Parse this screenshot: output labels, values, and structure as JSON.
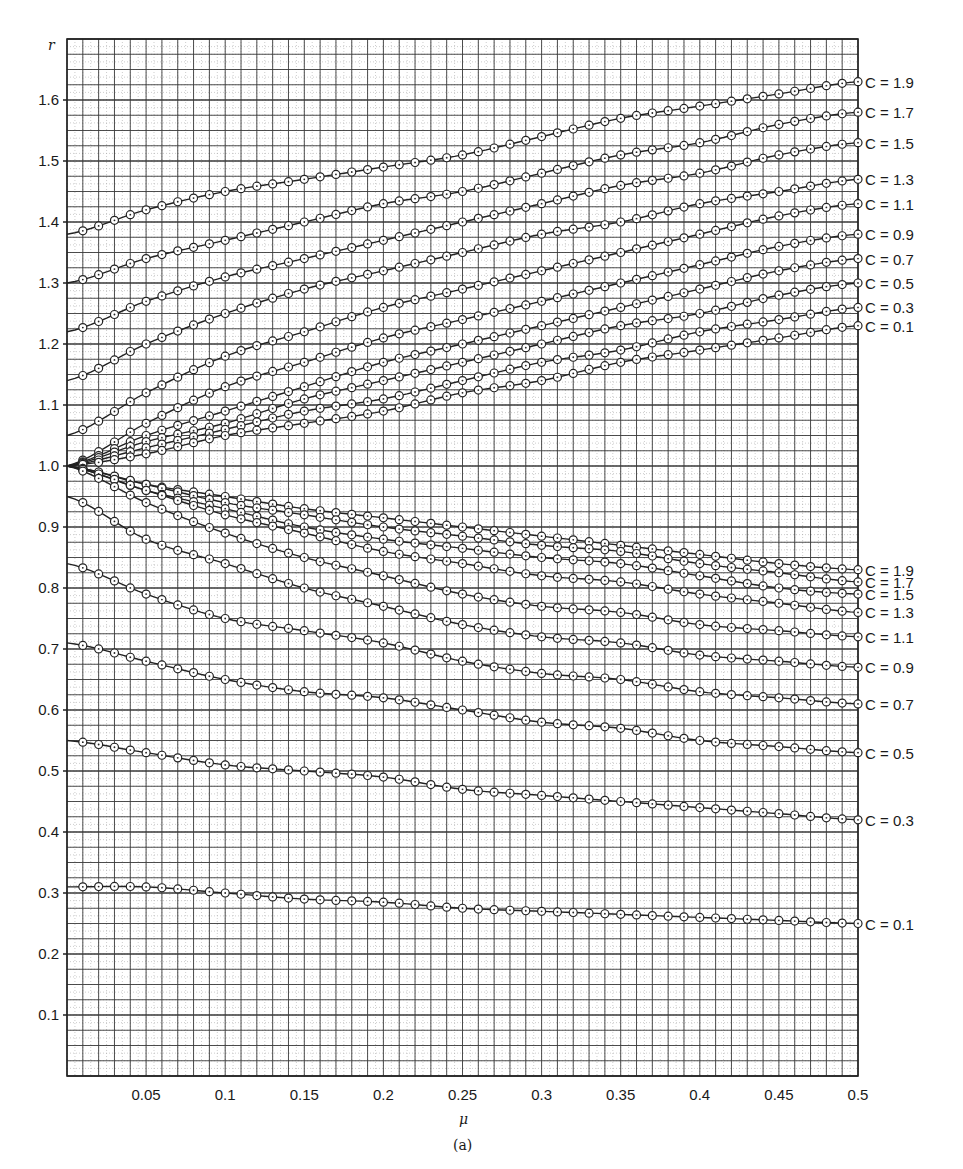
{
  "figure": {
    "caption": "(a)",
    "xlabel": "μ",
    "ylabel": "r"
  },
  "chart_data": {
    "type": "line",
    "title": "",
    "caption": "(a)",
    "xlabel": "μ",
    "ylabel": "r",
    "xlim": [
      0,
      0.5
    ],
    "ylim": [
      0,
      1.7
    ],
    "grid": true,
    "grid_major_x": 0.01,
    "grid_major_y": 0.025,
    "x_ticks": [
      0.05,
      0.1,
      0.15,
      0.2,
      0.25,
      0.3,
      0.35,
      0.4,
      0.45,
      0.5
    ],
    "x_tick_labels": [
      "0.05",
      "0.1",
      "0.15",
      "0.2",
      "0.25",
      "0.3",
      "0.35",
      "0.4",
      "0.45",
      "0.5"
    ],
    "y_ticks": [
      0.1,
      0.2,
      0.3,
      0.4,
      0.5,
      0.6,
      0.7,
      0.8,
      0.9,
      1.0,
      1.1,
      1.2,
      1.3,
      1.4,
      1.5,
      1.6
    ],
    "y_tick_labels": [
      "0.1",
      "0.2",
      "0.3",
      "0.4",
      "0.5",
      "0.6",
      "0.7",
      "0.8",
      "0.9",
      "1.0",
      "1.1",
      "1.2",
      "1.3",
      "1.4",
      "1.5",
      "1.6"
    ],
    "legend_position": "right-end labels",
    "marker": "circle-with-dot",
    "x": [
      0,
      0.05,
      0.1,
      0.15,
      0.2,
      0.25,
      0.3,
      0.35,
      0.4,
      0.45,
      0.5
    ],
    "series": [
      {
        "group": "upper",
        "name": "C = 1.9",
        "values": [
          1.38,
          1.42,
          1.45,
          1.47,
          1.49,
          1.51,
          1.54,
          1.57,
          1.59,
          1.61,
          1.63
        ]
      },
      {
        "group": "upper",
        "name": "C = 1.7",
        "values": [
          1.3,
          1.34,
          1.37,
          1.4,
          1.43,
          1.45,
          1.48,
          1.51,
          1.53,
          1.56,
          1.58
        ]
      },
      {
        "group": "upper",
        "name": "C = 1.5",
        "values": [
          1.22,
          1.27,
          1.31,
          1.34,
          1.37,
          1.4,
          1.43,
          1.46,
          1.48,
          1.51,
          1.53
        ]
      },
      {
        "group": "upper",
        "name": "C = 1.3",
        "values": [
          1.14,
          1.2,
          1.25,
          1.29,
          1.32,
          1.35,
          1.38,
          1.4,
          1.43,
          1.45,
          1.47
        ]
      },
      {
        "group": "upper",
        "name": "C = 1.1",
        "values": [
          1.05,
          1.12,
          1.18,
          1.22,
          1.26,
          1.29,
          1.32,
          1.35,
          1.38,
          1.41,
          1.43
        ]
      },
      {
        "group": "upper",
        "name": "C = 0.9",
        "values": [
          1.0,
          1.07,
          1.13,
          1.17,
          1.21,
          1.24,
          1.27,
          1.3,
          1.33,
          1.36,
          1.38
        ]
      },
      {
        "group": "upper",
        "name": "C = 0.7",
        "values": [
          1.0,
          1.05,
          1.09,
          1.13,
          1.17,
          1.2,
          1.23,
          1.26,
          1.29,
          1.32,
          1.34
        ]
      },
      {
        "group": "upper",
        "name": "C = 0.5",
        "values": [
          1.0,
          1.04,
          1.07,
          1.11,
          1.14,
          1.17,
          1.2,
          1.23,
          1.25,
          1.28,
          1.3
        ]
      },
      {
        "group": "upper",
        "name": "C = 0.3",
        "values": [
          1.0,
          1.03,
          1.06,
          1.09,
          1.11,
          1.14,
          1.17,
          1.19,
          1.22,
          1.24,
          1.26
        ]
      },
      {
        "group": "upper",
        "name": "C = 0.1",
        "values": [
          1.0,
          1.02,
          1.05,
          1.07,
          1.09,
          1.12,
          1.14,
          1.17,
          1.19,
          1.21,
          1.23
        ]
      },
      {
        "group": "lower",
        "name": "C = 1.9",
        "values": [
          1.0,
          0.97,
          0.95,
          0.93,
          0.915,
          0.9,
          0.885,
          0.87,
          0.855,
          0.84,
          0.83
        ]
      },
      {
        "group": "lower",
        "name": "C = 1.7",
        "values": [
          1.0,
          0.97,
          0.94,
          0.92,
          0.9,
          0.885,
          0.87,
          0.86,
          0.84,
          0.825,
          0.81
        ]
      },
      {
        "group": "lower",
        "name": "C = 1.5",
        "values": [
          1.0,
          0.96,
          0.93,
          0.9,
          0.88,
          0.865,
          0.85,
          0.84,
          0.82,
          0.8,
          0.79
        ]
      },
      {
        "group": "lower",
        "name": "C = 1.3",
        "values": [
          1.0,
          0.96,
          0.92,
          0.89,
          0.86,
          0.84,
          0.82,
          0.81,
          0.79,
          0.775,
          0.76
        ]
      },
      {
        "group": "lower",
        "name": "C = 1.1",
        "values": [
          1.0,
          0.94,
          0.89,
          0.85,
          0.82,
          0.79,
          0.77,
          0.76,
          0.74,
          0.73,
          0.72
        ]
      },
      {
        "group": "lower",
        "name": "C = 0.9",
        "values": [
          0.95,
          0.88,
          0.84,
          0.8,
          0.77,
          0.74,
          0.72,
          0.71,
          0.69,
          0.68,
          0.67
        ]
      },
      {
        "group": "lower",
        "name": "C = 0.7",
        "values": [
          0.84,
          0.79,
          0.75,
          0.73,
          0.71,
          0.68,
          0.66,
          0.65,
          0.63,
          0.62,
          0.61
        ]
      },
      {
        "group": "lower",
        "name": "C = 0.5",
        "values": [
          0.71,
          0.68,
          0.65,
          0.63,
          0.62,
          0.6,
          0.58,
          0.57,
          0.55,
          0.54,
          0.53
        ]
      },
      {
        "group": "lower",
        "name": "C = 0.3",
        "values": [
          0.55,
          0.53,
          0.51,
          0.5,
          0.49,
          0.47,
          0.46,
          0.45,
          0.44,
          0.43,
          0.42
        ]
      },
      {
        "group": "lower",
        "name": "C = 0.1",
        "values": [
          0.31,
          0.31,
          0.3,
          0.29,
          0.285,
          0.275,
          0.27,
          0.265,
          0.26,
          0.255,
          0.25
        ]
      }
    ]
  },
  "layout": {
    "plot_left": 67,
    "plot_right": 858,
    "plot_top": 39,
    "plot_bottom": 1076,
    "line_color": "#222222",
    "grid_major_color": "#3a3a3a",
    "grid_minor_color": "#9a9a9a"
  }
}
